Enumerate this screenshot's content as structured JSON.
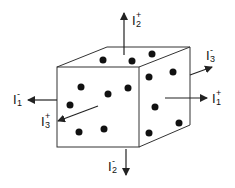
{
  "diagram": {
    "labels": {
      "I2_plus": {
        "base": "I",
        "sub": "2",
        "sup": "+"
      },
      "I2_minus": {
        "base": "I",
        "sub": "2",
        "sup": "-"
      },
      "I1_plus": {
        "base": "I",
        "sub": "1",
        "sup": "+"
      },
      "I1_minus": {
        "base": "I",
        "sub": "1",
        "sup": "-"
      },
      "I3_plus": {
        "base": "I",
        "sub": "3",
        "sup": "+"
      },
      "I3_minus": {
        "base": "I",
        "sub": "3",
        "sup": "-"
      }
    },
    "stroke_color": "#222222",
    "dot_color": "#111111"
  }
}
